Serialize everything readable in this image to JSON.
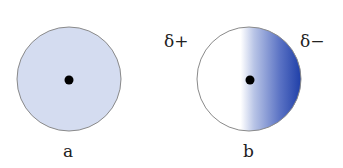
{
  "panels": [
    {
      "label": "a",
      "type": "uniform-charge-cloud",
      "fill": "#d4dcf0"
    },
    {
      "label": "b",
      "type": "polarized-charge-cloud",
      "gradient_from": "#ffffff",
      "gradient_to": "#1f3fa8"
    }
  ],
  "charges": {
    "positive": "δ+",
    "negative": "δ−"
  },
  "colors": {
    "outline": "#8a8a8a",
    "nucleus": "#000000"
  }
}
